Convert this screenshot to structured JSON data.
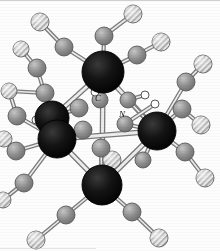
{
  "figure": {
    "caption": "",
    "background_color": "#fdfdfd",
    "width": 220,
    "height": 251
  },
  "legend": {
    "metal": {
      "name": "metal-atom",
      "style": "solid-black-sphere",
      "color": "#111111",
      "radius": 17
    },
    "carbon": {
      "name": "carbon-atom",
      "style": "gray-shaded-sphere",
      "color": "#8a8a8a",
      "radius": 9
    },
    "oxygen": {
      "name": "oxygen-atom",
      "style": "diagonal-hatched-sphere",
      "color": "#b9b9b9",
      "radius": 9
    },
    "bridging": {
      "name": "bridging-ligand-atom",
      "style": "open-outline-circle",
      "color": "#ffffff",
      "radius": 4
    },
    "bond": {
      "name": "bond-stick",
      "color": "#9d9d9d",
      "highlight": "#e8e8e8"
    }
  },
  "labels": [
    {
      "id": "label-c",
      "text": "C",
      "x": 98,
      "y": 101
    },
    {
      "id": "label-n",
      "text": "N",
      "x": 122,
      "y": 117
    }
  ],
  "metal_atoms": [
    {
      "id": "metal-top",
      "x": 103,
      "y": 72,
      "r": 21
    },
    {
      "id": "metal-left-a",
      "x": 52,
      "y": 118,
      "r": 17
    },
    {
      "id": "metal-left-b",
      "x": 57,
      "y": 139,
      "r": 19
    },
    {
      "id": "metal-right",
      "x": 157,
      "y": 131,
      "r": 19
    },
    {
      "id": "metal-bottom",
      "x": 102,
      "y": 185,
      "r": 20
    }
  ],
  "carbon_atoms": [
    {
      "id": "c-01",
      "x": 64,
      "y": 47,
      "r": 9
    },
    {
      "id": "c-02",
      "x": 104,
      "y": 36,
      "r": 9
    },
    {
      "id": "c-03",
      "x": 137,
      "y": 55,
      "r": 9
    },
    {
      "id": "c-04",
      "x": 37,
      "y": 68,
      "r": 9
    },
    {
      "id": "c-05",
      "x": 45,
      "y": 93,
      "r": 9
    },
    {
      "id": "c-06",
      "x": 17,
      "y": 116,
      "r": 9
    },
    {
      "id": "c-07",
      "x": 186,
      "y": 82,
      "r": 9
    },
    {
      "id": "c-08",
      "x": 182,
      "y": 109,
      "r": 9
    },
    {
      "id": "c-09",
      "x": 16,
      "y": 151,
      "r": 9
    },
    {
      "id": "c-10",
      "x": 185,
      "y": 152,
      "r": 9
    },
    {
      "id": "c-11",
      "x": 24,
      "y": 183,
      "r": 9
    },
    {
      "id": "c-12",
      "x": 66,
      "y": 215,
      "r": 9
    },
    {
      "id": "c-13",
      "x": 132,
      "y": 212,
      "r": 9
    },
    {
      "id": "c-14",
      "x": 100,
      "y": 100,
      "r": 8
    },
    {
      "id": "c-15",
      "x": 79,
      "y": 108,
      "r": 9
    },
    {
      "id": "c-16",
      "x": 83,
      "y": 130,
      "r": 9
    },
    {
      "id": "c-17",
      "x": 101,
      "y": 148,
      "r": 9
    },
    {
      "id": "c-18",
      "x": 128,
      "y": 100,
      "r": 8
    },
    {
      "id": "c-19",
      "x": 125,
      "y": 124,
      "r": 8
    },
    {
      "id": "c-20",
      "x": 143,
      "y": 160,
      "r": 8
    }
  ],
  "oxygen_atoms": [
    {
      "id": "o-01",
      "x": 40,
      "y": 22,
      "r": 9
    },
    {
      "id": "o-02",
      "x": 133,
      "y": 14,
      "r": 9
    },
    {
      "id": "o-03",
      "x": 21,
      "y": 49,
      "r": 8
    },
    {
      "id": "o-04",
      "x": 161,
      "y": 42,
      "r": 9
    },
    {
      "id": "o-05",
      "x": 9,
      "y": 91,
      "r": 8
    },
    {
      "id": "o-06",
      "x": 203,
      "y": 64,
      "r": 9
    },
    {
      "id": "o-07",
      "x": 4,
      "y": 139,
      "r": 8
    },
    {
      "id": "o-08",
      "x": 201,
      "y": 125,
      "r": 9
    },
    {
      "id": "o-09",
      "x": 205,
      "y": 178,
      "r": 9
    },
    {
      "id": "o-10",
      "x": 3,
      "y": 200,
      "r": 8
    },
    {
      "id": "o-11",
      "x": 112,
      "y": 160,
      "r": 9
    },
    {
      "id": "o-12",
      "x": 36,
      "y": 240,
      "r": 9
    },
    {
      "id": "o-13",
      "x": 159,
      "y": 238,
      "r": 9
    }
  ],
  "bridging_atoms": [
    {
      "id": "b-01",
      "x": 145,
      "y": 95,
      "r": 4
    },
    {
      "id": "b-02",
      "x": 155,
      "y": 104,
      "r": 4
    },
    {
      "id": "b-03",
      "x": 36,
      "y": 120,
      "r": 4
    },
    {
      "id": "b-04",
      "x": 95,
      "y": 92,
      "r": 4
    }
  ],
  "bonds": [
    {
      "from": "metal-top",
      "to": "c-01"
    },
    {
      "from": "metal-top",
      "to": "c-02"
    },
    {
      "from": "metal-top",
      "to": "c-03"
    },
    {
      "from": "c-01",
      "to": "o-01"
    },
    {
      "from": "c-02",
      "to": "o-02"
    },
    {
      "from": "c-03",
      "to": "o-04"
    },
    {
      "from": "metal-left-a",
      "to": "c-04"
    },
    {
      "from": "metal-left-a",
      "to": "c-05"
    },
    {
      "from": "c-04",
      "to": "o-03"
    },
    {
      "from": "c-05",
      "to": "o-05"
    },
    {
      "from": "metal-left-b",
      "to": "c-06"
    },
    {
      "from": "metal-left-b",
      "to": "c-09"
    },
    {
      "from": "metal-left-b",
      "to": "c-11"
    },
    {
      "from": "c-06",
      "to": "o-05"
    },
    {
      "from": "c-09",
      "to": "o-07"
    },
    {
      "from": "c-11",
      "to": "o-10"
    },
    {
      "from": "metal-right",
      "to": "c-07"
    },
    {
      "from": "metal-right",
      "to": "c-08"
    },
    {
      "from": "metal-right",
      "to": "c-10"
    },
    {
      "from": "c-07",
      "to": "o-06"
    },
    {
      "from": "c-08",
      "to": "o-08"
    },
    {
      "from": "c-10",
      "to": "o-09"
    },
    {
      "from": "metal-bottom",
      "to": "c-12"
    },
    {
      "from": "metal-bottom",
      "to": "c-13"
    },
    {
      "from": "c-12",
      "to": "o-12"
    },
    {
      "from": "c-13",
      "to": "o-13"
    },
    {
      "from": "metal-top",
      "to": "metal-left-a"
    },
    {
      "from": "metal-top",
      "to": "metal-right"
    },
    {
      "from": "metal-top",
      "to": "metal-bottom"
    },
    {
      "from": "metal-left-b",
      "to": "metal-right"
    },
    {
      "from": "metal-left-b",
      "to": "metal-bottom"
    },
    {
      "from": "metal-right",
      "to": "metal-bottom"
    },
    {
      "from": "metal-top",
      "to": "c-14"
    },
    {
      "from": "metal-left-a",
      "to": "c-15"
    },
    {
      "from": "metal-left-b",
      "to": "c-16"
    },
    {
      "from": "metal-bottom",
      "to": "c-17"
    },
    {
      "from": "metal-right",
      "to": "c-18"
    },
    {
      "from": "metal-right",
      "to": "c-19"
    },
    {
      "from": "metal-right",
      "to": "c-20"
    },
    {
      "from": "c-17",
      "to": "o-11"
    },
    {
      "from": "c-18",
      "to": "b-01"
    },
    {
      "from": "c-19",
      "to": "b-02"
    },
    {
      "from": "metal-left-a",
      "to": "b-03"
    },
    {
      "from": "c-14",
      "to": "b-04"
    }
  ]
}
